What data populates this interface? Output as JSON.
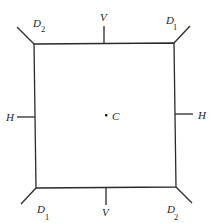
{
  "diagram": {
    "type": "square-with-symmetry-axes",
    "center_label": "C",
    "labels": {
      "top_left": {
        "main": "D",
        "sub": "2"
      },
      "top_right": {
        "main": "D",
        "sub": "1"
      },
      "bottom_left": {
        "main": "D",
        "sub": "1"
      },
      "bottom_right": {
        "main": "D",
        "sub": "2"
      },
      "top": "V",
      "bottom": "V",
      "left": "H",
      "right": "H"
    }
  }
}
